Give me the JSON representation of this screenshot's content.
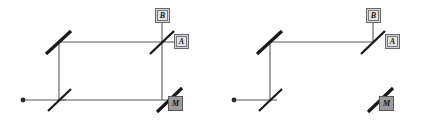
{
  "figure": {
    "background_color": "#ffffff",
    "beam_color": "#585858",
    "mirror_color": "#1a1a1a",
    "box_fill": "#d2d2d2",
    "box_fill_active": "#9b9b9b",
    "box_border": "#6b6b6b"
  },
  "panels": [
    {
      "id": "left",
      "caption": "",
      "source": {
        "label": "",
        "x": 22,
        "y": 100
      },
      "detectors": [
        {
          "name": "B",
          "label": "B",
          "filled": false,
          "x": 155,
          "y": 8
        },
        {
          "name": "A",
          "label": "A",
          "filled": false,
          "x": 174,
          "y": 34
        },
        {
          "name": "M",
          "label": "M",
          "filled": true,
          "x": 168,
          "y": 96
        }
      ],
      "optics": [
        {
          "type": "mirror",
          "name": "mirror-top-left"
        },
        {
          "type": "beamsplitter",
          "name": "beamsplitter-bottom-left"
        },
        {
          "type": "beamsplitter",
          "name": "beamsplitter-top-right"
        },
        {
          "type": "mirror",
          "name": "mirror-bottom-right"
        }
      ],
      "beams": [
        {
          "name": "beam-source-in"
        },
        {
          "name": "beam-left-vertical"
        },
        {
          "name": "beam-top-horizontal"
        },
        {
          "name": "beam-right-vertical"
        },
        {
          "name": "beam-bottom-horizontal"
        },
        {
          "name": "beam-out-to-B"
        },
        {
          "name": "beam-out-to-A"
        }
      ]
    },
    {
      "id": "right",
      "caption": "",
      "source": {
        "label": "",
        "x": 22,
        "y": 100
      },
      "detectors": [
        {
          "name": "B",
          "label": "B",
          "filled": false,
          "x": 155,
          "y": 8
        },
        {
          "name": "A",
          "label": "A",
          "filled": false,
          "x": 174,
          "y": 34
        },
        {
          "name": "M",
          "label": "M",
          "filled": true,
          "x": 168,
          "y": 96
        }
      ],
      "optics": [
        {
          "type": "mirror",
          "name": "mirror-top-left"
        },
        {
          "type": "beamsplitter",
          "name": "beamsplitter-bottom-left"
        },
        {
          "type": "beamsplitter",
          "name": "beamsplitter-top-right"
        },
        {
          "type": "mirror",
          "name": "mirror-bottom-right-blocked"
        }
      ],
      "beams": [
        {
          "name": "beam-source-in"
        },
        {
          "name": "beam-left-vertical"
        },
        {
          "name": "beam-top-horizontal"
        },
        {
          "name": "beam-out-to-B"
        }
      ]
    }
  ]
}
